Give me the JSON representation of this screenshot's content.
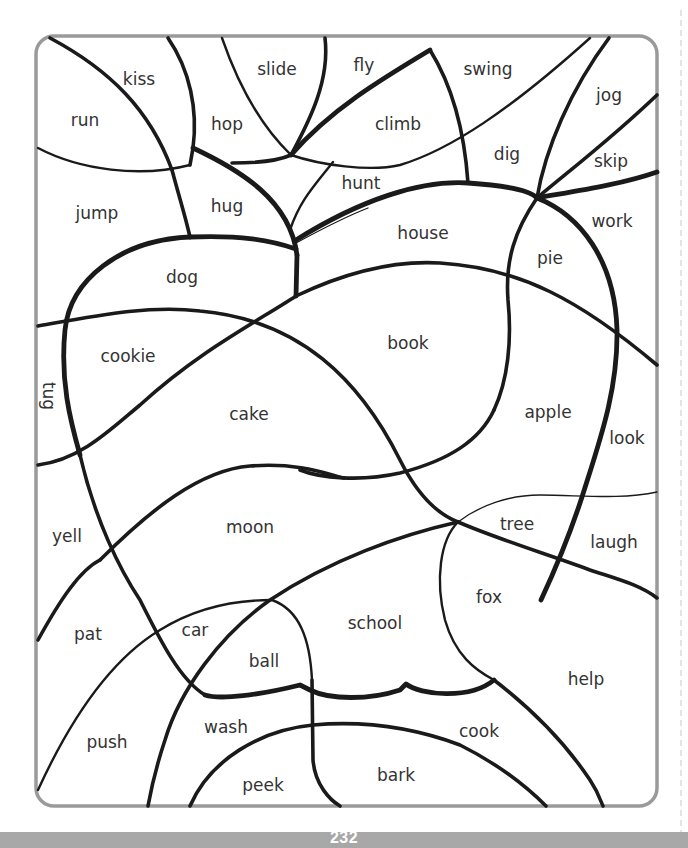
{
  "page": {
    "page_number": "232",
    "frame_color": "#9a9a9a",
    "footer_color": "#a8a8a8",
    "line_color": "#1a1a1a"
  },
  "puzzle": {
    "words": [
      {
        "id": "kiss",
        "text": "kiss",
        "x": 139,
        "y": 80
      },
      {
        "id": "slide",
        "text": "slide",
        "x": 277,
        "y": 70
      },
      {
        "id": "fly",
        "text": "fly",
        "x": 364,
        "y": 66
      },
      {
        "id": "swing",
        "text": "swing",
        "x": 488,
        "y": 70
      },
      {
        "id": "jog",
        "text": "jog",
        "x": 609,
        "y": 96
      },
      {
        "id": "run",
        "text": "run",
        "x": 85,
        "y": 121
      },
      {
        "id": "hop",
        "text": "hop",
        "x": 227,
        "y": 125
      },
      {
        "id": "climb",
        "text": "climb",
        "x": 398,
        "y": 125
      },
      {
        "id": "dig",
        "text": "dig",
        "x": 507,
        "y": 155
      },
      {
        "id": "skip",
        "text": "skip",
        "x": 611,
        "y": 162
      },
      {
        "id": "hunt",
        "text": "hunt",
        "x": 361,
        "y": 184
      },
      {
        "id": "jump",
        "text": "jump",
        "x": 97,
        "y": 214
      },
      {
        "id": "hug",
        "text": "hug",
        "x": 227,
        "y": 207
      },
      {
        "id": "house",
        "text": "house",
        "x": 423,
        "y": 234
      },
      {
        "id": "work",
        "text": "work",
        "x": 612,
        "y": 222
      },
      {
        "id": "pie",
        "text": "pie",
        "x": 550,
        "y": 259
      },
      {
        "id": "dog",
        "text": "dog",
        "x": 182,
        "y": 278
      },
      {
        "id": "book",
        "text": "book",
        "x": 408,
        "y": 344
      },
      {
        "id": "cookie",
        "text": "cookie",
        "x": 128,
        "y": 357
      },
      {
        "id": "tug",
        "text": "tug",
        "x": 48,
        "y": 396,
        "rotate": 90
      },
      {
        "id": "cake",
        "text": "cake",
        "x": 249,
        "y": 415
      },
      {
        "id": "apple",
        "text": "apple",
        "x": 548,
        "y": 413
      },
      {
        "id": "look",
        "text": "look",
        "x": 627,
        "y": 439
      },
      {
        "id": "yell",
        "text": "yell",
        "x": 67,
        "y": 537
      },
      {
        "id": "moon",
        "text": "moon",
        "x": 250,
        "y": 528
      },
      {
        "id": "tree",
        "text": "tree",
        "x": 517,
        "y": 525
      },
      {
        "id": "laugh",
        "text": "laugh",
        "x": 614,
        "y": 543
      },
      {
        "id": "fox",
        "text": "fox",
        "x": 489,
        "y": 598
      },
      {
        "id": "pat",
        "text": "pat",
        "x": 88,
        "y": 635
      },
      {
        "id": "car",
        "text": "car",
        "x": 195,
        "y": 631
      },
      {
        "id": "school",
        "text": "school",
        "x": 375,
        "y": 624
      },
      {
        "id": "ball",
        "text": "ball",
        "x": 264,
        "y": 662
      },
      {
        "id": "help",
        "text": "help",
        "x": 586,
        "y": 680
      },
      {
        "id": "wash",
        "text": "wash",
        "x": 226,
        "y": 728
      },
      {
        "id": "cook",
        "text": "cook",
        "x": 479,
        "y": 732
      },
      {
        "id": "push",
        "text": "push",
        "x": 107,
        "y": 743
      },
      {
        "id": "bark",
        "text": "bark",
        "x": 396,
        "y": 776
      },
      {
        "id": "peek",
        "text": "peek",
        "x": 263,
        "y": 786
      }
    ]
  }
}
